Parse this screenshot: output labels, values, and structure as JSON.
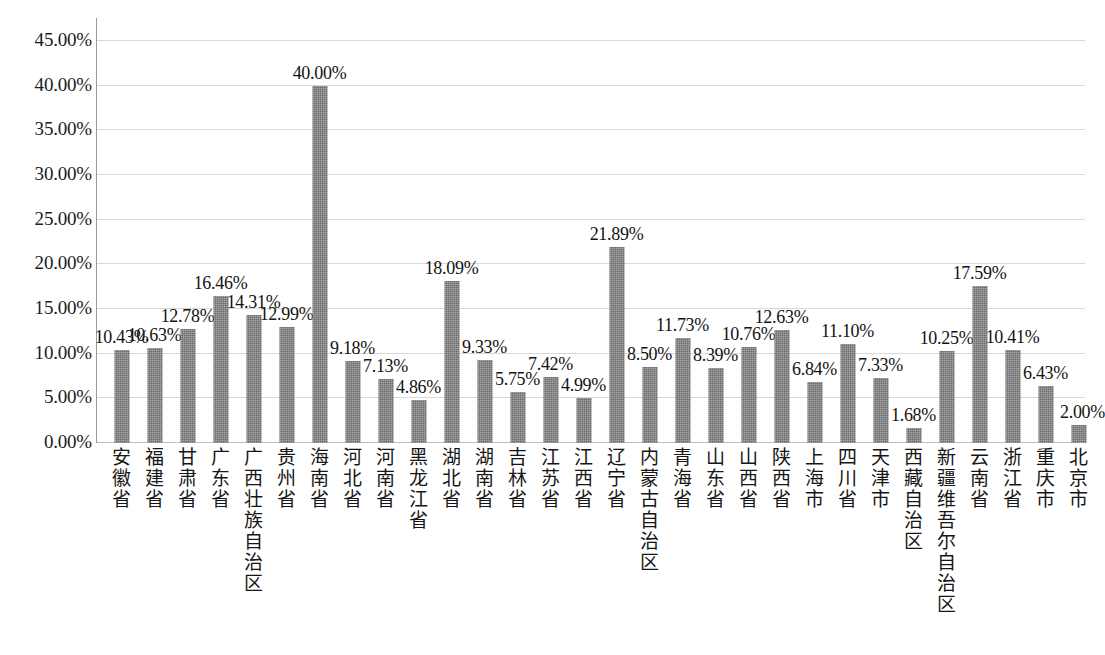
{
  "chart_data": {
    "type": "bar",
    "title": "",
    "subtitle": "",
    "xlabel": "",
    "ylabel": "",
    "ylim": [
      0,
      45
    ],
    "ytick_step": 5,
    "ytick_labels": [
      "45.00%",
      "40.00%",
      "35.00%",
      "30.00%",
      "25.00%",
      "20.00%",
      "15.00%",
      "10.00%",
      "5.00%",
      "0.00%"
    ],
    "ytick_values": [
      45,
      40,
      35,
      30,
      25,
      20,
      15,
      10,
      5,
      0
    ],
    "grid": true,
    "legend": "none",
    "series_name": "",
    "bar_color": "#7b7b7b",
    "categories": [
      "安徽省",
      "福建省",
      "甘肃省",
      "广东省",
      "广西壮族自治区",
      "贵州省",
      "海南省",
      "河北省",
      "河南省",
      "黑龙江省",
      "湖北省",
      "湖南省",
      "吉林省",
      "江苏省",
      "江西省",
      "辽宁省",
      "内蒙古自治区",
      "青海省",
      "山东省",
      "山西省",
      "陕西省",
      "上海市",
      "四川省",
      "天津市",
      "西藏自治区",
      "新疆维吾尔自治区",
      "云南省",
      "浙江省",
      "重庆市",
      "北京市"
    ],
    "values": [
      10.43,
      10.63,
      12.78,
      16.46,
      14.31,
      12.99,
      40.0,
      9.18,
      7.13,
      4.86,
      18.09,
      9.33,
      5.75,
      7.42,
      4.99,
      21.89,
      8.5,
      11.73,
      8.39,
      10.76,
      12.63,
      6.84,
      11.1,
      7.33,
      1.68,
      10.25,
      17.59,
      10.41,
      6.43,
      2.0
    ],
    "value_labels": [
      "10.43%",
      "10.63%",
      "12.78%",
      "16.46%",
      "14.31%",
      "12.99%",
      "40.00%",
      "9.18%",
      "7.13%",
      "4.86%",
      "18.09%",
      "9.33%",
      "5.75%",
      "7.42%",
      "4.99%",
      "21.89%",
      "8.50%",
      "11.73%",
      "8.39%",
      "10.76%",
      "12.63%",
      "6.84%",
      "11.10%",
      "7.33%",
      "1.68%",
      "10.25%",
      "17.59%",
      "10.41%",
      "6.43%",
      "2.00%"
    ]
  }
}
